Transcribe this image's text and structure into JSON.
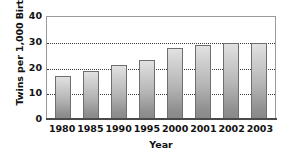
{
  "chart_data": {
    "type": "bar",
    "title": "",
    "categories": [
      "1980",
      "1985",
      "1990",
      "1995",
      "2000",
      "2001",
      "2002",
      "2003"
    ],
    "values": [
      17,
      19,
      21,
      23,
      28,
      29,
      30,
      30
    ],
    "xlabel": "Year",
    "ylabel": "Twins per 1,000 Births",
    "ylim": [
      0,
      40
    ],
    "yticks": [
      "0",
      "10",
      "20",
      "30",
      "40"
    ],
    "ytick_values": [
      0,
      10,
      20,
      30,
      40
    ],
    "gridlines": [
      10,
      20,
      30
    ],
    "grid": true,
    "legend": "none",
    "bar_color": "#b4b4b4",
    "bar_edge_color": "#6e6e6e",
    "axis_color": "#4a4a4a",
    "grid_color": "#3a3a3a",
    "background": "#ffffff"
  }
}
